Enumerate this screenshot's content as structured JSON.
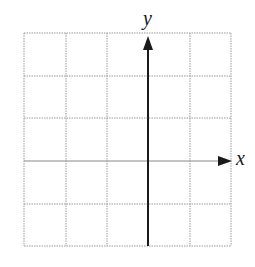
{
  "diagram": {
    "type": "coordinate-grid",
    "x_axis_label": "x",
    "y_axis_label": "y",
    "grid": {
      "columns": 5,
      "rows": 5,
      "line_style": "dotted",
      "line_color": "#9a9a9a"
    },
    "axes": {
      "color": "#1a1a1a",
      "y_axis_position": "between column 3 and 4 from left",
      "x_axis_position": "between row 3 and 4 from top",
      "arrows": [
        "positive-x",
        "positive-y"
      ]
    }
  }
}
